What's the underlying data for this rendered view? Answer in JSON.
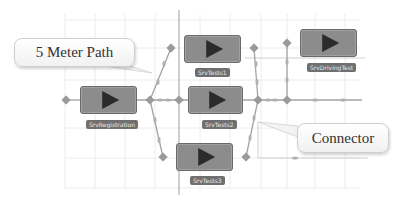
{
  "diagram": {
    "colors": {
      "grid": "#e6e6e6",
      "axis": "#9a9a9a",
      "connector": "#a6a6a6",
      "node_fill": "#8c8c8c",
      "label_fill": "#6f6f6f",
      "accent_line": "#b9b9b9"
    },
    "nodes": [
      {
        "id": "SrvRegistration",
        "label": "SrvRegistration"
      },
      {
        "id": "SrvTests1",
        "label": "SrvTests1"
      },
      {
        "id": "SrvTests2",
        "label": "SrvTests2"
      },
      {
        "id": "SrvTests3",
        "label": "SrvTests3"
      },
      {
        "id": "SrvDrivingTest",
        "label": "SrvDrivingTest"
      }
    ],
    "callouts": [
      {
        "id": "five-meter-path",
        "text": "5 Meter Path"
      },
      {
        "id": "connector",
        "text": "Connector"
      }
    ]
  }
}
